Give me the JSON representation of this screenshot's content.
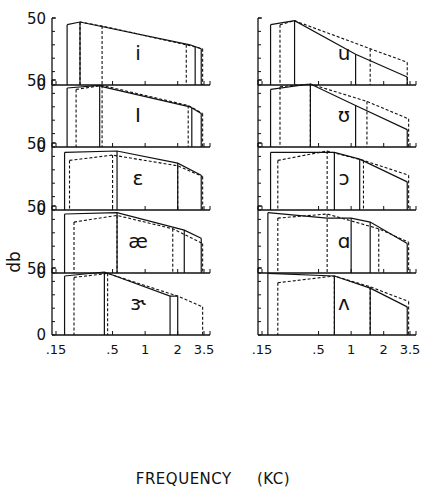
{
  "figure": {
    "ylabel": "db",
    "xlabel_word": "FREQUENCY",
    "xlabel_unit": "(KC)"
  },
  "chart_data": {
    "type": "line",
    "title": "",
    "xlabel": "FREQUENCY (KC)",
    "ylabel": "db",
    "xscale": "log",
    "xlim": [
      0.15,
      3.5
    ],
    "ylim": [
      0,
      50
    ],
    "xticks": [
      0.15,
      0.5,
      1,
      2,
      3.5
    ],
    "xtick_labels": [
      ".15",
      ".5",
      "1",
      "2",
      "3.5"
    ],
    "yticks": [
      0,
      10,
      20,
      30,
      40,
      50
    ],
    "ytick_labels_shown": [
      "0",
      "50"
    ],
    "grid": false,
    "legend": "none (solid vs dashed outlines)",
    "panels": [
      {
        "vowel": "i",
        "column": "left",
        "row": 0,
        "solid": {
          "x": [
            0.19,
            0.25,
            2.6,
            3.3
          ],
          "y": [
            45,
            47,
            30,
            27
          ],
          "edges": [
            0.19,
            0.25,
            2.9,
            3.3
          ]
        },
        "dashed": {
          "x": [
            0.25,
            0.4,
            2.4,
            3.4
          ],
          "y": [
            47,
            44,
            30,
            27
          ],
          "edges": [
            0.25,
            0.4,
            2.4,
            3.4
          ]
        }
      },
      {
        "vowel": "I",
        "column": "left",
        "row": 1,
        "solid": {
          "x": [
            0.19,
            0.38,
            0.4,
            2.6,
            3.3
          ],
          "y": [
            44,
            46,
            45,
            30,
            25
          ],
          "edges": [
            0.19,
            0.38,
            2.7,
            3.3
          ]
        },
        "dashed": {
          "x": [
            0.23,
            0.4,
            2.5,
            3.4
          ],
          "y": [
            43,
            46,
            31,
            25
          ],
          "edges": [
            0.23,
            0.4,
            2.5,
            3.4
          ]
        }
      },
      {
        "vowel": "ε",
        "column": "left",
        "row": 2,
        "solid": {
          "x": [
            0.18,
            0.55,
            2.0,
            3.3
          ],
          "y": [
            43,
            44,
            35,
            26
          ],
          "edges": [
            0.18,
            0.55,
            2.0,
            3.3
          ]
        },
        "dashed": {
          "x": [
            0.2,
            0.5,
            2.0,
            3.4
          ],
          "y": [
            37,
            41,
            33,
            25
          ],
          "edges": [
            0.2,
            0.5,
            2.0,
            3.4
          ]
        }
      },
      {
        "vowel": "æ",
        "column": "left",
        "row": 3,
        "solid": {
          "x": [
            0.18,
            0.55,
            2.3,
            3.3
          ],
          "y": [
            44,
            45,
            32,
            26
          ],
          "edges": [
            0.18,
            0.55,
            2.3,
            3.3
          ]
        },
        "dashed": {
          "x": [
            0.22,
            0.55,
            1.8,
            3.4
          ],
          "y": [
            38,
            43,
            33,
            22
          ],
          "edges": [
            0.22,
            0.55,
            1.8,
            3.4
          ]
        }
      },
      {
        "vowel": "ɝ",
        "column": "left",
        "row": 4,
        "solid": {
          "x": [
            0.18,
            0.42,
            1.7,
            2.0
          ],
          "y": [
            44,
            47,
            29,
            29
          ],
          "edges": [
            0.18,
            0.42,
            1.7,
            2.0
          ]
        },
        "dashed": {
          "x": [
            0.22,
            0.45,
            2.0,
            3.4
          ],
          "y": [
            43,
            46,
            29,
            21
          ],
          "edges": [
            0.22,
            0.45,
            3.4
          ]
        }
      },
      {
        "vowel": "u",
        "column": "right",
        "row": 0,
        "solid": {
          "x": [
            0.18,
            0.3,
            1.1,
            3.3
          ],
          "y": [
            45,
            48,
            23,
            6
          ],
          "edges": [
            0.18,
            0.3,
            1.1,
            3.3
          ]
        },
        "dashed": {
          "x": [
            0.22,
            0.3,
            1.5,
            3.3
          ],
          "y": [
            45,
            48,
            27,
            17
          ],
          "edges": [
            0.22,
            1.5,
            3.3
          ]
        }
      },
      {
        "vowel": "ʊ",
        "column": "right",
        "row": 1,
        "solid": {
          "x": [
            0.18,
            0.42,
            1.1,
            3.3
          ],
          "y": [
            43,
            47,
            31,
            13
          ],
          "edges": [
            0.18,
            0.42,
            1.1,
            3.3
          ]
        },
        "dashed": {
          "x": [
            0.22,
            0.42,
            1.4,
            3.4
          ],
          "y": [
            45,
            47,
            34,
            21
          ],
          "edges": [
            0.22,
            0.42,
            1.4,
            3.4
          ]
        }
      },
      {
        "vowel": "ɔ",
        "column": "right",
        "row": 2,
        "solid": {
          "x": [
            0.18,
            0.7,
            1.2,
            3.3
          ],
          "y": [
            43,
            43,
            38,
            21
          ],
          "edges": [
            0.18,
            0.7,
            1.2,
            3.3
          ]
        },
        "dashed": {
          "x": [
            0.21,
            0.6,
            1.3,
            3.4
          ],
          "y": [
            37,
            44,
            37,
            26
          ],
          "edges": [
            0.21,
            0.6,
            1.3,
            3.4
          ]
        }
      },
      {
        "vowel": "ɑ",
        "column": "right",
        "row": 3,
        "solid": {
          "x": [
            0.17,
            0.6,
            1.0,
            1.5,
            3.3
          ],
          "y": [
            45,
            41,
            41,
            38,
            22
          ],
          "edges": [
            0.17,
            1.0,
            1.5,
            3.3
          ]
        },
        "dashed": {
          "x": [
            0.21,
            0.6,
            1.8,
            3.4
          ],
          "y": [
            41,
            44,
            33,
            23
          ],
          "edges": [
            0.21,
            0.6,
            1.8,
            3.4
          ]
        }
      },
      {
        "vowel": "ʌ",
        "column": "right",
        "row": 4,
        "solid": {
          "x": [
            0.17,
            0.7,
            1.5,
            3.3
          ],
          "y": [
            46,
            44,
            35,
            21
          ],
          "edges": [
            0.17,
            0.7,
            1.5,
            3.3
          ]
        },
        "dashed": {
          "x": [
            0.21,
            0.7,
            1.5,
            3.4
          ],
          "y": [
            39,
            44,
            36,
            25
          ],
          "edges": [
            0.21,
            0.7,
            1.5,
            3.4
          ]
        }
      }
    ]
  }
}
